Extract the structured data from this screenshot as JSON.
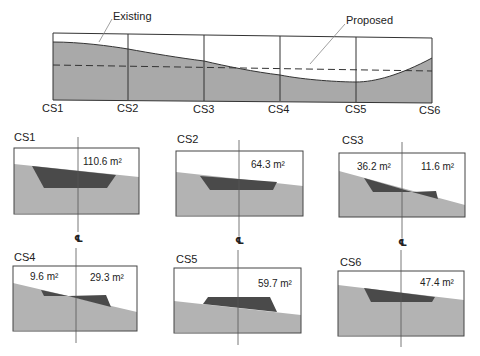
{
  "profile": {
    "labels": {
      "existing": "Existing",
      "proposed": "Proposed"
    },
    "stations": [
      "CS1",
      "CS2",
      "CS3",
      "CS4",
      "CS5",
      "CS6"
    ],
    "colors": {
      "ground": "#a9a9a9",
      "outline": "#333333",
      "proposed_line": "#333333"
    }
  },
  "cross_sections": [
    {
      "name": "CS1",
      "areas": [
        "110.6 m²"
      ],
      "type": "cut"
    },
    {
      "name": "CS2",
      "areas": [
        "64.3 m²"
      ],
      "type": "cut"
    },
    {
      "name": "CS3",
      "areas": [
        "36.2 m²",
        "11.6 m²"
      ],
      "type": "cut-fill"
    },
    {
      "name": "CS4",
      "areas": [
        "9.6 m²",
        "29.3 m²"
      ],
      "type": "cut-fill"
    },
    {
      "name": "CS5",
      "areas": [
        "59.7 m²"
      ],
      "type": "fill"
    },
    {
      "name": "CS6",
      "areas": [
        "47.4 m²"
      ],
      "type": "cut"
    }
  ],
  "centerline_symbol": "℄",
  "colors": {
    "ground": "#b3b3b3",
    "earthwork": "#4a4a4a",
    "outline": "#444444"
  }
}
